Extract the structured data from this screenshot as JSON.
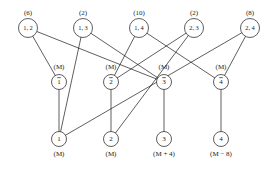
{
  "diagram": {
    "type": "bipartite-assignment-network",
    "rows": {
      "top": {
        "name": "pair-nodes-row",
        "nodes": [
          {
            "id": "p12",
            "label": "1, 2",
            "cost": "(6)",
            "x": 28,
            "y": 28
          },
          {
            "id": "p13",
            "label": "1, 3",
            "cost": "(2)",
            "x": 83,
            "y": 28
          },
          {
            "id": "p14",
            "label": "1, 4",
            "cost": "(10)",
            "x": 139,
            "y": 28
          },
          {
            "id": "p23",
            "label": "2, 3",
            "cost": "(2)",
            "x": 194,
            "y": 28
          },
          {
            "id": "p24",
            "label": "2, 4",
            "cost": "(8)",
            "x": 250,
            "y": 28
          }
        ]
      },
      "middle": {
        "name": "bar-nodes-row",
        "nodes": [
          {
            "id": "b1",
            "label": "1",
            "overline": true,
            "cost": "(M)",
            "x": 59,
            "y": 82
          },
          {
            "id": "b2",
            "label": "2",
            "overline": true,
            "cost": "(M)",
            "x": 111,
            "y": 82
          },
          {
            "id": "b3",
            "label": "3",
            "overline": true,
            "cost": "(M)",
            "x": 164,
            "y": 82
          },
          {
            "id": "b4",
            "label": "4",
            "overline": true,
            "cost": "(M)",
            "x": 221,
            "y": 82
          }
        ]
      },
      "bottom": {
        "name": "index-nodes-row",
        "nodes": [
          {
            "id": "n1",
            "label": "1",
            "cost": "(M)",
            "x": 59,
            "y": 139
          },
          {
            "id": "n2",
            "label": "2",
            "cost": "(M)",
            "x": 111,
            "y": 139
          },
          {
            "id": "n3",
            "label": "3",
            "cost": "(M + 4)",
            "x": 164,
            "y": 139
          },
          {
            "id": "n4",
            "label": "4",
            "cost": "(M − 8)",
            "x": 221,
            "y": 139
          }
        ]
      }
    },
    "edges": [
      {
        "from": "p12",
        "to": "b1"
      },
      {
        "from": "p12",
        "to": "b3"
      },
      {
        "from": "p13",
        "to": "n1"
      },
      {
        "from": "p13",
        "to": "b3"
      },
      {
        "from": "p14",
        "to": "b2"
      },
      {
        "from": "p14",
        "to": "b4"
      },
      {
        "from": "p23",
        "to": "b2"
      },
      {
        "from": "p23",
        "to": "n2"
      },
      {
        "from": "p24",
        "to": "b4"
      },
      {
        "from": "p24",
        "to": "n1"
      },
      {
        "from": "b1",
        "to": "n1"
      },
      {
        "from": "b2",
        "to": "n2"
      },
      {
        "from": "b3",
        "to": "n3"
      },
      {
        "from": "b4",
        "to": "n4"
      }
    ],
    "geometry": {
      "node_radius": 9.5,
      "node_radius_small": 7.5,
      "cost_offset_top": -13,
      "cost_offset_bottom": 17
    },
    "colors": {
      "ink": "#1a1a1a",
      "paper": "#ffffff"
    }
  }
}
